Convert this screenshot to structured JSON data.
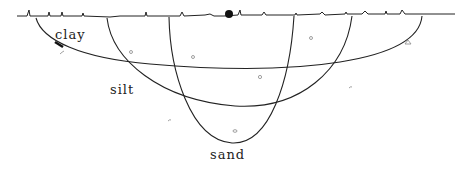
{
  "diagram": {
    "type": "soil cross-section",
    "labels": {
      "clay": "clay",
      "silt": "silt",
      "sand": "sand"
    },
    "layers": [
      {
        "name": "clay",
        "outline": "widest, shallowest bowl"
      },
      {
        "name": "silt",
        "outline": "medium bowl"
      },
      {
        "name": "sand",
        "outline": "narrowest, deepest bowl"
      }
    ],
    "colors": {
      "line": "#222222",
      "background": "#ffffff",
      "specks": "#888888"
    }
  }
}
